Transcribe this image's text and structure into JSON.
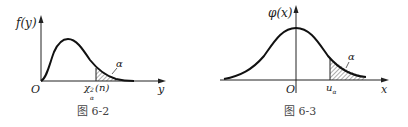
{
  "figures": [
    {
      "caption": "图 6-2",
      "y_axis_label": "f(y)",
      "x_axis_label": "y",
      "origin_label": "O",
      "quantile_label": "χ²α(n)",
      "quantile_main": "χ",
      "quantile_sup": "2",
      "quantile_sub": "α",
      "quantile_arg": "(n)",
      "area_label": "α",
      "distribution": "chi-square density"
    },
    {
      "caption": "图 6-3",
      "y_axis_label": "φ(x)",
      "x_axis_label": "x",
      "origin_label": "O",
      "quantile_main": "u",
      "quantile_sub": "α",
      "area_label": "α",
      "distribution": "standard normal density"
    }
  ],
  "colors": {
    "curve": "#111111",
    "axis": "#222222",
    "hatch": "#333333",
    "caption": "#444444"
  }
}
